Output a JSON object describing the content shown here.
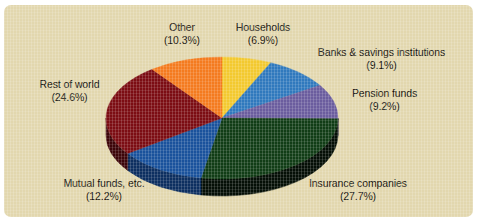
{
  "figure": {
    "background_color": "#e2d7ae",
    "frame_color": "#ffffff",
    "text_color": "#15120c"
  },
  "chart_data": {
    "type": "pie",
    "title": "",
    "subtitle": "",
    "xlabel": "",
    "ylabel": "",
    "legend_position": "none",
    "grid": false,
    "three_d": true,
    "start_angle_clock": "12 o'clock",
    "direction": "clockwise",
    "unit": "%",
    "categories": [
      "Households",
      "Banks & savings institutions",
      "Pension funds",
      "Insurance companies",
      "Mutual funds, etc.",
      "Rest of world",
      "Other"
    ],
    "values": [
      6.9,
      9.1,
      9.2,
      27.7,
      12.2,
      24.6,
      10.3
    ],
    "colors": [
      "#f3c92f",
      "#3079bd",
      "#6b5d9e",
      "#113d16",
      "#1a529c",
      "#7c0d13",
      "#f47b1f"
    ],
    "side_colors": [
      "#a8881a",
      "#1d4e7c",
      "#453a68",
      "#050f06",
      "#0d2f60",
      "#3d0509",
      "#a64d0b"
    ],
    "slices": [
      {
        "label": "Households",
        "value": 6.9,
        "display": "(6.9%)",
        "color": "#f3c92f"
      },
      {
        "label": "Banks & savings institutions",
        "value": 9.1,
        "display": "(9.1%)",
        "color": "#3079bd"
      },
      {
        "label": "Pension funds",
        "value": 9.2,
        "display": "(9.2%)",
        "color": "#6b5d9e"
      },
      {
        "label": "Insurance companies",
        "value": 27.7,
        "display": "(27.7%)",
        "color": "#113d16"
      },
      {
        "label": "Mutual funds, etc.",
        "value": 12.2,
        "display": "(12.2%)",
        "color": "#1a529c"
      },
      {
        "label": "Rest of world",
        "value": 24.6,
        "display": "(24.6%)",
        "color": "#7c0d13"
      },
      {
        "label": "Other",
        "value": 10.3,
        "display": "(10.3%)",
        "color": "#f47b1f"
      }
    ]
  },
  "labels": {
    "other": {
      "name": "Other",
      "pct": "(10.3%)"
    },
    "households": {
      "name": "Households",
      "pct": "(6.9%)"
    },
    "banks": {
      "name": "Banks & savings institutions",
      "pct": "(9.1%)"
    },
    "pension": {
      "name": "Pension funds",
      "pct": "(9.2%)"
    },
    "insurance": {
      "name": "Insurance companies",
      "pct": "(27.7%)"
    },
    "mutual": {
      "name": "Mutual funds, etc.",
      "pct": "(12.2%)"
    },
    "restofworld": {
      "name": "Rest of world",
      "pct": "(24.6%)"
    }
  }
}
